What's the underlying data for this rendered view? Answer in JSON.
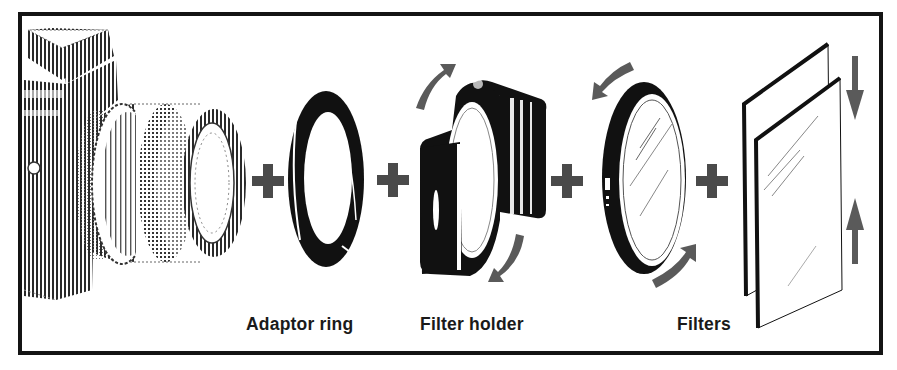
{
  "diagram": {
    "components": [
      {
        "id": "camera",
        "label": ""
      },
      {
        "id": "adaptor-ring",
        "label": "Adaptor ring"
      },
      {
        "id": "filter-holder",
        "label": "Filter holder"
      },
      {
        "id": "round-filter",
        "label": ""
      },
      {
        "id": "filters",
        "label": "Filters"
      }
    ],
    "connectors": [
      "+",
      "+",
      "+",
      "+"
    ],
    "colors": {
      "frame": "#141414",
      "ink": "#111111",
      "plus": "#4a4a4a",
      "arrow": "#5a5a5a",
      "background": "#ffffff"
    },
    "icons": {
      "camera": "camera-icon",
      "adaptor_ring": "ring-icon",
      "filter_holder": "holder-icon",
      "round_filter": "round-filter-icon",
      "square_filters": "square-filter-icon",
      "rotate_arrows": "rotate-arrow-icon",
      "slide_arrows": "slide-arrow-icon",
      "plus": "plus-icon"
    }
  }
}
